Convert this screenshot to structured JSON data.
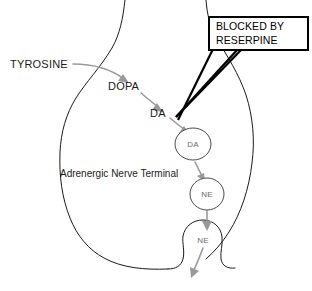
{
  "diagram": {
    "terminal_label": "Adrenergic Nerve Terminal",
    "pathway": {
      "precursor_label": "TYROSINE",
      "step1_label": "DOPA",
      "step2_label": "DA"
    },
    "vesicles": [
      {
        "label": "DA"
      },
      {
        "label": "NE"
      },
      {
        "label": "NE"
      }
    ],
    "callout": {
      "line1": "BLOCKED BY",
      "line2": "RESERPINE"
    },
    "colors": {
      "membrane": "#1a1a1a",
      "arrow": "#9a9a9a",
      "vesicle_stroke": "#4a4a4a",
      "vesicle_text": "#6b6b6b",
      "callout_border": "#000000",
      "text": "#1a1a1a",
      "background": "#ffffff"
    }
  }
}
